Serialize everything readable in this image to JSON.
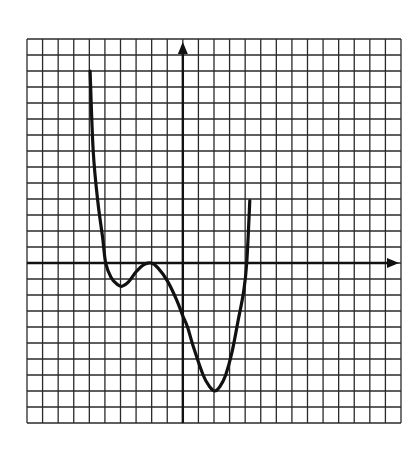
{
  "chart_data": {
    "type": "line",
    "title": "",
    "xlabel": "",
    "ylabel": "",
    "grid": true,
    "grid_columns": 24,
    "grid_rows": 24,
    "xlim": [
      -10,
      14
    ],
    "ylim": [
      -10,
      14
    ],
    "x_axis_arrow": true,
    "y_axis_arrow": true,
    "tick_labels": false,
    "legend": null,
    "series": [
      {
        "name": "f(x)",
        "color": "#111111",
        "x": [
          -5.95,
          -5.75,
          -5.45,
          -5.15,
          -4.95,
          -4.6,
          -4.2,
          -3.9,
          -3.5,
          -3.0,
          -2.5,
          -2.05,
          -1.6,
          -1.0,
          -0.4,
          0.0,
          0.3,
          0.7,
          1.3,
          1.7,
          2.05,
          2.4,
          2.75,
          3.15,
          3.55,
          3.9,
          4.1,
          4.3
        ],
        "y": [
          12.0,
          7.0,
          3.8,
          1.6,
          0.0,
          -0.9,
          -1.35,
          -1.45,
          -1.2,
          -0.55,
          -0.1,
          0.0,
          -0.3,
          -1.1,
          -2.3,
          -3.3,
          -4.0,
          -5.3,
          -7.0,
          -7.7,
          -8.0,
          -7.7,
          -7.0,
          -5.6,
          -3.6,
          -1.8,
          0.0,
          3.9
        ]
      }
    ],
    "key_points": {
      "x_intercepts": [
        -5,
        -2,
        4
      ],
      "local_min_left": [
        -4,
        -1.4
      ],
      "local_max_tangent": [
        -2,
        0
      ],
      "y_intercept": [
        0,
        -3.3
      ],
      "global_min": [
        2,
        -8
      ]
    }
  },
  "layout": {
    "grid_left_px": 27,
    "grid_top_px": 39,
    "cell_w_px": 15.583,
    "cell_h_px": 16,
    "origin_col": 10,
    "origin_row": 14,
    "grid_color": "#2a2a2a",
    "axis_color": "#111111",
    "curve_color": "#111111",
    "background": "#ffffff"
  }
}
